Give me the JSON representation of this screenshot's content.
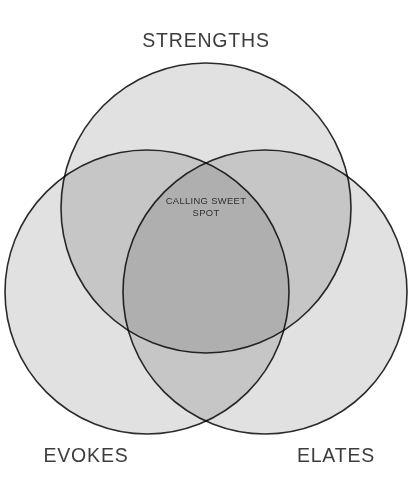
{
  "diagram": {
    "type": "venn",
    "title": "",
    "background_color": "#ffffff",
    "circle_fill_color": "#9d9d9d",
    "circle_fill_opacity": 0.3,
    "circle_stroke_color": "#2b2b2b",
    "label_color": "#3d3d3d",
    "center_label_color": "#2f2f2f",
    "sets": [
      {
        "id": "strengths",
        "label": "STRENGTHS",
        "position": "top",
        "cx": 206,
        "cy": 208,
        "r": 145,
        "label_x": 206,
        "label_y": 47
      },
      {
        "id": "evokes",
        "label": "EVOKES",
        "position": "bottom-left",
        "cx": 147,
        "cy": 292,
        "r": 142,
        "label_x": 86,
        "label_y": 462
      },
      {
        "id": "elates",
        "label": "ELATES",
        "position": "bottom-right",
        "cx": 265,
        "cy": 292,
        "r": 142,
        "label_x": 336,
        "label_y": 462
      }
    ],
    "intersection": {
      "id": "calling-sweet-spot",
      "line1": "CALLING SWEET",
      "line2": "SPOT",
      "x": 206,
      "y1": 204,
      "y2": 216
    }
  }
}
